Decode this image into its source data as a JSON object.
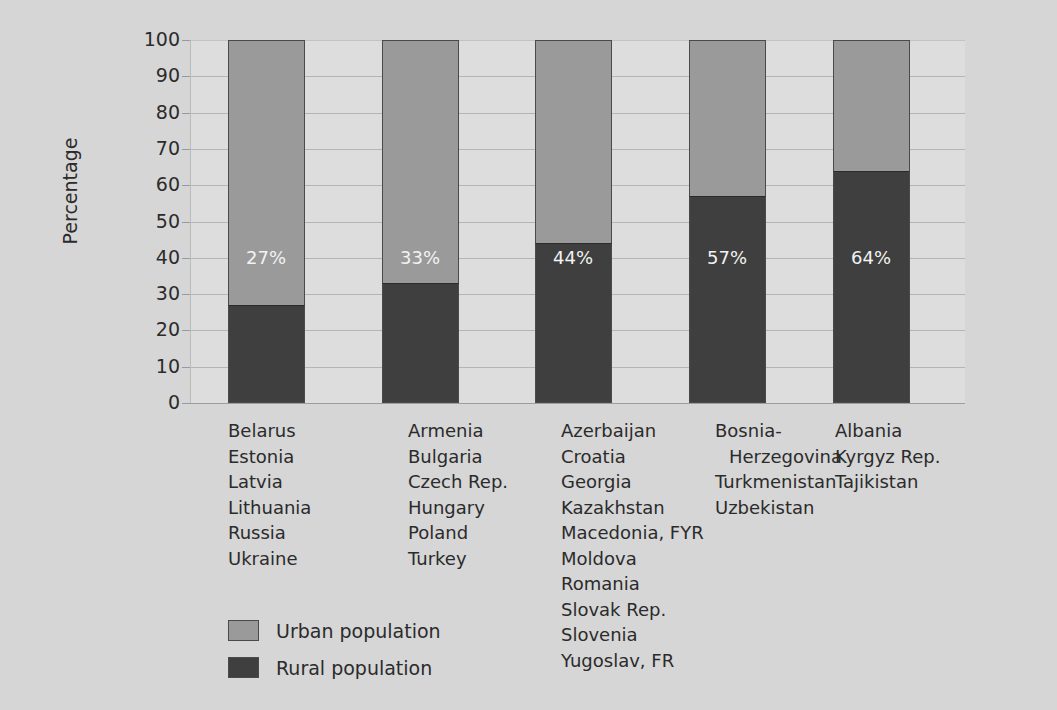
{
  "chart_data": {
    "type": "bar",
    "subtype": "stacked-100-percent",
    "title": "",
    "xlabel": "",
    "ylabel": "Percentage",
    "ylim": [
      0,
      100
    ],
    "y_ticks": [
      100,
      90,
      80,
      70,
      60,
      50,
      40,
      30,
      20,
      10,
      0
    ],
    "grid": true,
    "legend_position": "bottom-left",
    "categories": [
      "Group 1",
      "Group 2",
      "Group 3",
      "Group 4",
      "Group 5"
    ],
    "series": [
      {
        "name": "Urban population",
        "color": "#9a9a9a",
        "values": [
          73,
          67,
          56,
          43,
          36
        ]
      },
      {
        "name": "Rural population",
        "color": "#3f3f3f",
        "values": [
          27,
          33,
          44,
          57,
          64
        ]
      }
    ],
    "bar_labels": [
      "27%",
      "33%",
      "44%",
      "57%",
      "64%"
    ]
  },
  "chart": {
    "title": "",
    "y_axis": {
      "title": "Percentage",
      "ticks": [
        "100",
        "90",
        "80",
        "70",
        "60",
        "50",
        "40",
        "30",
        "20",
        "10",
        "0"
      ]
    },
    "bars": [
      {
        "rural_value": 27,
        "urban_value": 73,
        "label": "27%",
        "countries": [
          {
            "name": "Belarus",
            "indent": false
          },
          {
            "name": "Estonia",
            "indent": false
          },
          {
            "name": "Latvia",
            "indent": false
          },
          {
            "name": "Lithuania",
            "indent": false
          },
          {
            "name": "Russia",
            "indent": false
          },
          {
            "name": "Ukraine",
            "indent": false
          }
        ]
      },
      {
        "rural_value": 33,
        "urban_value": 67,
        "label": "33%",
        "countries": [
          {
            "name": "Armenia",
            "indent": false
          },
          {
            "name": "Bulgaria",
            "indent": false
          },
          {
            "name": "Czech Rep.",
            "indent": false
          },
          {
            "name": "Hungary",
            "indent": false
          },
          {
            "name": "Poland",
            "indent": false
          },
          {
            "name": "Turkey",
            "indent": false
          }
        ]
      },
      {
        "rural_value": 44,
        "urban_value": 56,
        "label": "44%",
        "countries": [
          {
            "name": "Azerbaijan",
            "indent": false
          },
          {
            "name": "Croatia",
            "indent": false
          },
          {
            "name": "Georgia",
            "indent": false
          },
          {
            "name": "Kazakhstan",
            "indent": false
          },
          {
            "name": "Macedonia, FYR",
            "indent": false
          },
          {
            "name": "Moldova",
            "indent": false
          },
          {
            "name": "Romania",
            "indent": false
          },
          {
            "name": "Slovak Rep.",
            "indent": false
          },
          {
            "name": "Slovenia",
            "indent": false
          },
          {
            "name": "Yugoslav, FR",
            "indent": false
          }
        ]
      },
      {
        "rural_value": 57,
        "urban_value": 43,
        "label": "57%",
        "countries": [
          {
            "name": "Bosnia-",
            "indent": false
          },
          {
            "name": "Herzegovina",
            "indent": true
          },
          {
            "name": "Turkmenistan",
            "indent": false
          },
          {
            "name": "Uzbekistan",
            "indent": false
          }
        ]
      },
      {
        "rural_value": 64,
        "urban_value": 36,
        "label": "64%",
        "countries": [
          {
            "name": "Albania",
            "indent": false
          },
          {
            "name": "Kyrgyz Rep.",
            "indent": false
          },
          {
            "name": "Tajikistan",
            "indent": false
          }
        ]
      }
    ],
    "legend": [
      {
        "label": "Urban population",
        "swatch": "urban",
        "color": "#9a9a9a"
      },
      {
        "label": "Rural population",
        "swatch": "rural",
        "color": "#3f3f3f"
      }
    ]
  },
  "colors": {
    "page_background": "#d6d6d6",
    "plot_background": "#dddddd",
    "urban": "#9a9a9a",
    "rural": "#3f3f3f",
    "gridline": "#b4b4b4",
    "text": "#2b2b2b"
  }
}
